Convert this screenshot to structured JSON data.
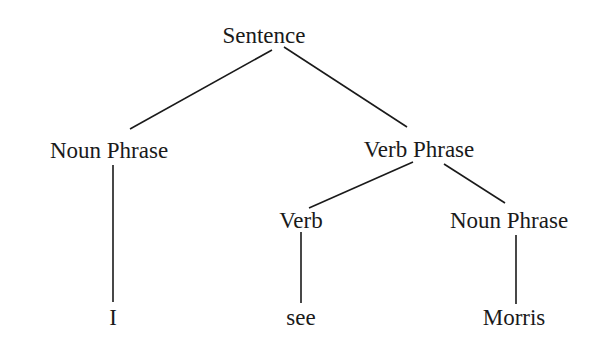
{
  "tree": {
    "nodes": {
      "sentence": "Sentence",
      "noun_phrase_1": "Noun Phrase",
      "verb_phrase": "Verb Phrase",
      "verb": "Verb",
      "noun_phrase_2": "Noun Phrase",
      "word_i": "I",
      "word_see": "see",
      "word_morris": "Morris"
    },
    "edges": [
      [
        "Sentence",
        "Noun Phrase"
      ],
      [
        "Sentence",
        "Verb Phrase"
      ],
      [
        "Noun Phrase",
        "I"
      ],
      [
        "Verb Phrase",
        "Verb"
      ],
      [
        "Verb Phrase",
        "Noun Phrase"
      ],
      [
        "Verb",
        "see"
      ],
      [
        "Noun Phrase",
        "Morris"
      ]
    ]
  }
}
